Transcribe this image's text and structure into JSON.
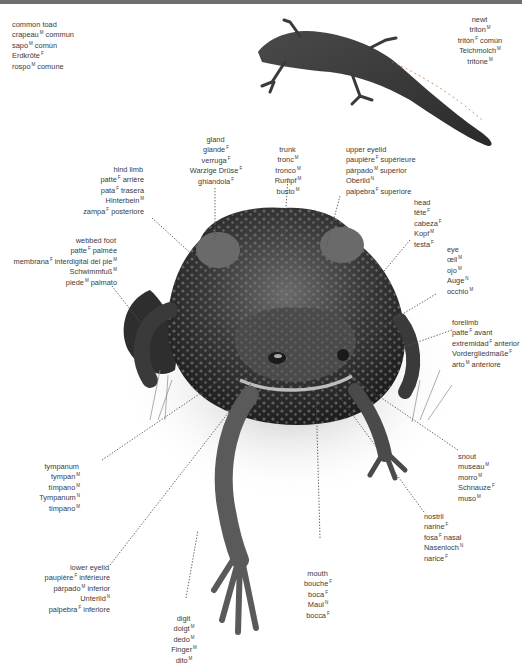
{
  "header": {
    "bar_label": ""
  },
  "title_block": {
    "lines": [
      {
        "text": "common toad",
        "g": ""
      },
      {
        "text": "crapeau",
        "g": "M",
        "tail": " commun"
      },
      {
        "text": "sapo",
        "g": "M",
        "tail": " común"
      },
      {
        "text": "Erdkröte",
        "g": "F",
        "tail": ""
      },
      {
        "text": "rospo",
        "g": "M",
        "tail": " comune"
      }
    ]
  },
  "labels": {
    "newt": [
      {
        "text": "newt",
        "g": "",
        "tail": ""
      },
      {
        "text": "triton",
        "g": "M",
        "tail": ""
      },
      {
        "text": "tritón",
        "g": "F",
        "tail": " común"
      },
      {
        "text": "Teichmolch",
        "g": "M",
        "tail": ""
      },
      {
        "text": "tritone",
        "g": "M",
        "tail": ""
      }
    ],
    "gland": [
      {
        "text": "gland",
        "g": "",
        "tail": ""
      },
      {
        "text": "glande",
        "g": "F",
        "tail": ""
      },
      {
        "text": "verruga",
        "g": "F",
        "tail": ""
      },
      {
        "text": "Warzige Drüse",
        "g": "F",
        "tail": ""
      },
      {
        "text": "ghiandola",
        "g": "F",
        "tail": ""
      }
    ],
    "trunk": [
      {
        "text": "trunk",
        "g": "",
        "tail": ""
      },
      {
        "text": "tronc",
        "g": "M",
        "tail": ""
      },
      {
        "text": "tronco",
        "g": "M",
        "tail": ""
      },
      {
        "text": "Rumpf",
        "g": "M",
        "tail": ""
      },
      {
        "text": "busto",
        "g": "M",
        "tail": ""
      }
    ],
    "upper_eyelid": [
      {
        "text": "upper eyelid",
        "g": "",
        "tail": ""
      },
      {
        "text": "paupière",
        "g": "F",
        "tail": " supérieure"
      },
      {
        "text": "párpado",
        "g": "M",
        "tail": " superior"
      },
      {
        "text": "Oberlid",
        "g": "N",
        "tail": ""
      },
      {
        "text": "palpebra",
        "g": "F",
        "tail": " superiore"
      }
    ],
    "hind_limb": [
      {
        "text": "hind limb",
        "g": "",
        "tail": ""
      },
      {
        "text": "patte",
        "g": "F",
        "tail": " arrière"
      },
      {
        "text": "pata",
        "g": "F",
        "tail": " trasera"
      },
      {
        "text": "Hinterbein",
        "g": "M",
        "tail": ""
      },
      {
        "text": "zampa",
        "g": "F",
        "tail": " posteriore"
      }
    ],
    "head": [
      {
        "text": "head",
        "g": "",
        "tail": ""
      },
      {
        "text": "tête",
        "g": "F",
        "tail": ""
      },
      {
        "text": "cabeza",
        "g": "F",
        "tail": ""
      },
      {
        "text": "Kopf",
        "g": "M",
        "tail": ""
      },
      {
        "text": "testa",
        "g": "F",
        "tail": ""
      }
    ],
    "eye": [
      {
        "text": "eye",
        "g": "",
        "tail": ""
      },
      {
        "text": "œil",
        "g": "M",
        "tail": ""
      },
      {
        "text": "ojo",
        "g": "M",
        "tail": ""
      },
      {
        "text": "Auge",
        "g": "N",
        "tail": ""
      },
      {
        "text": "occhio",
        "g": "M",
        "tail": ""
      }
    ],
    "webbed_foot": [
      {
        "text": "webbed foot",
        "g": "",
        "tail": ""
      },
      {
        "text": "patte",
        "g": "F",
        "tail": " palmée"
      },
      {
        "text": "membrana",
        "g": "F",
        "tail": " interdigital del pie",
        "g2": "M"
      },
      {
        "text": "Schwimmfuß",
        "g": "M",
        "tail": ""
      },
      {
        "text": "piede",
        "g": "M",
        "tail": " palmato"
      }
    ],
    "forelimb": [
      {
        "text": "forelimb",
        "g": "",
        "tail": ""
      },
      {
        "text": "patte",
        "g": "F",
        "tail": " avant"
      },
      {
        "text": "extremidad",
        "g": "F",
        "tail": " anterior"
      },
      {
        "text": "Vordergliedmaße",
        "g": "F",
        "tail": ""
      },
      {
        "text": "arto",
        "g": "M",
        "tail": " anteriore"
      }
    ],
    "tympanum": [
      {
        "text": "tympanum",
        "g": "",
        "tail": ""
      },
      {
        "text": "tympan",
        "g": "M",
        "tail": ""
      },
      {
        "text": "tímpano",
        "g": "M",
        "tail": ""
      },
      {
        "text": "Tympanum",
        "g": "N",
        "tail": ""
      },
      {
        "text": "timpano",
        "g": "M",
        "tail": ""
      }
    ],
    "snout": [
      {
        "text": "snout",
        "g": "",
        "tail": ""
      },
      {
        "text": "museau",
        "g": "M",
        "tail": ""
      },
      {
        "text": "morro",
        "g": "M",
        "tail": ""
      },
      {
        "text": "Schnauze",
        "g": "F",
        "tail": ""
      },
      {
        "text": "muso",
        "g": "M",
        "tail": ""
      }
    ],
    "nostril": [
      {
        "text": "nostril",
        "g": "",
        "tail": ""
      },
      {
        "text": "narine",
        "g": "F",
        "tail": ""
      },
      {
        "text": "fosa",
        "g": "F",
        "tail": " nasal"
      },
      {
        "text": "Nasenloch",
        "g": "N",
        "tail": ""
      },
      {
        "text": "narice",
        "g": "F",
        "tail": ""
      }
    ],
    "lower_eyelid": [
      {
        "text": "lower eyelid",
        "g": "",
        "tail": ""
      },
      {
        "text": "paupière",
        "g": "F",
        "tail": " inférieure"
      },
      {
        "text": "párpado",
        "g": "M",
        "tail": " inferior"
      },
      {
        "text": "Unterlid",
        "g": "N",
        "tail": ""
      },
      {
        "text": "palpebra",
        "g": "F",
        "tail": " inferiore"
      }
    ],
    "mouth": [
      {
        "text": "mouth",
        "g": "",
        "tail": ""
      },
      {
        "text": "bouche",
        "g": "F",
        "tail": ""
      },
      {
        "text": "boca",
        "g": "F",
        "tail": ""
      },
      {
        "text": "Maul",
        "g": "N",
        "tail": ""
      },
      {
        "text": "bocca",
        "g": "F",
        "tail": ""
      }
    ],
    "digit": [
      {
        "text": "digit",
        "g": "",
        "tail": ""
      },
      {
        "text": "doigt",
        "g": "M",
        "tail": ""
      },
      {
        "text": "dedo",
        "g": "M",
        "tail": ""
      },
      {
        "text": "Finger",
        "g": "M",
        "tail": ""
      },
      {
        "text": "dito",
        "g": "M",
        "tail": ""
      }
    ]
  },
  "colors": {
    "text": "#3a3a3a",
    "toad_dark": "#2a2a2a",
    "toad_mid": "#5a5a5a",
    "newt": "#3b3b3b",
    "header_bar": "#6e6e6e"
  }
}
